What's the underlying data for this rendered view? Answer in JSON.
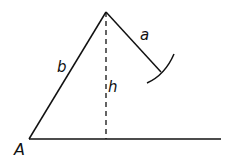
{
  "diagram": {
    "labels": {
      "a": "a",
      "b": "b",
      "h": "h",
      "A": "A"
    },
    "colors": {
      "stroke": "#111111",
      "background": "#ffffff"
    }
  }
}
